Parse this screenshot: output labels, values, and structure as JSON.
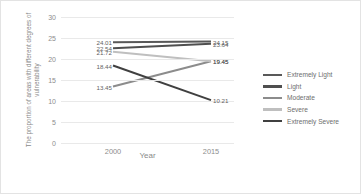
{
  "chart_data": {
    "type": "line",
    "title": "",
    "xlabel": "Year",
    "ylabel": "The proportion of areas with different degrees of vulnerability",
    "categories": [
      "2000",
      "2015"
    ],
    "x_tick_labels": [
      "2000",
      "2015"
    ],
    "y_tick_labels": [
      "0",
      "5",
      "10",
      "15",
      "20",
      "25",
      "30"
    ],
    "y_ticks": [
      0,
      5,
      10,
      15,
      20,
      25,
      30
    ],
    "ylim": [
      0,
      30
    ],
    "grid": true,
    "legend_position": "right",
    "series": [
      {
        "name": "Extremely Light",
        "color": "#595959",
        "values": [
          24.01,
          24.15
        ],
        "labels": [
          "24.01",
          "24.15"
        ]
      },
      {
        "name": "Light",
        "color": "#4f4f4f",
        "values": [
          22.54,
          23.64
        ],
        "labels": [
          "22.54",
          "23.64"
        ]
      },
      {
        "name": "Moderate",
        "color": "#8c8c8c",
        "values": [
          13.45,
          19.45
        ],
        "labels": [
          "13.45",
          "19.45"
        ]
      },
      {
        "name": "Severe",
        "color": "#bfbfbf",
        "values": [
          21.72,
          19.45
        ],
        "labels": [
          "21.72",
          "19.45"
        ]
      },
      {
        "name": "Extremely Severe",
        "color": "#404040",
        "values": [
          18.44,
          10.21
        ],
        "labels": [
          "18.44",
          "10.21"
        ]
      }
    ]
  }
}
